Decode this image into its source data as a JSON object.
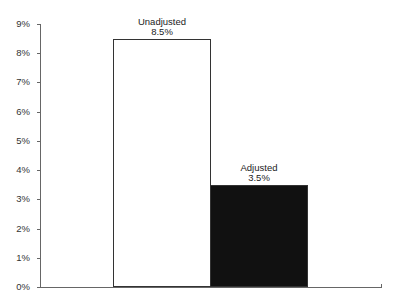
{
  "chart_data": {
    "type": "bar",
    "title": "",
    "xlabel": "",
    "ylabel": "",
    "categories": [
      "Unadjusted",
      "Adjusted"
    ],
    "values": [
      8.5,
      3.5
    ],
    "value_labels": [
      "8.5%",
      "3.5%"
    ],
    "bar_colors": [
      "#ffffff",
      "#111111"
    ],
    "bar_edge_color": "#333333",
    "ylim": [
      0,
      9
    ],
    "yticks": [
      "0%",
      "1%",
      "2%",
      "3%",
      "4%",
      "5%",
      "6%",
      "7%",
      "8%",
      "9%"
    ],
    "grid": false,
    "legend": "none"
  }
}
